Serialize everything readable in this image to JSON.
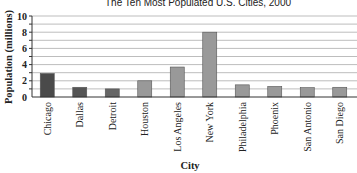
{
  "chart_data": {
    "type": "bar",
    "title": "The Ten Most Populated U.S. Cities, 2000",
    "xlabel": "City",
    "ylabel": "Population (millions)",
    "ylim": [
      0,
      10
    ],
    "yticks": [
      0,
      2,
      4,
      6,
      8,
      10
    ],
    "grid": true,
    "categories": [
      "Chicago",
      "Dallas",
      "Detroit",
      "Houston",
      "Los Angeles",
      "New York",
      "Philadelphia",
      "Phoenix",
      "San Antonio",
      "San Diego"
    ],
    "values": [
      2.9,
      1.2,
      1.0,
      2.0,
      3.7,
      8.0,
      1.5,
      1.3,
      1.15,
      1.2
    ],
    "bar_colors": [
      "#4a4a4a",
      "#555555",
      "#666666",
      "#999999",
      "#999999",
      "#999999",
      "#999999",
      "#999999",
      "#999999",
      "#999999"
    ]
  }
}
